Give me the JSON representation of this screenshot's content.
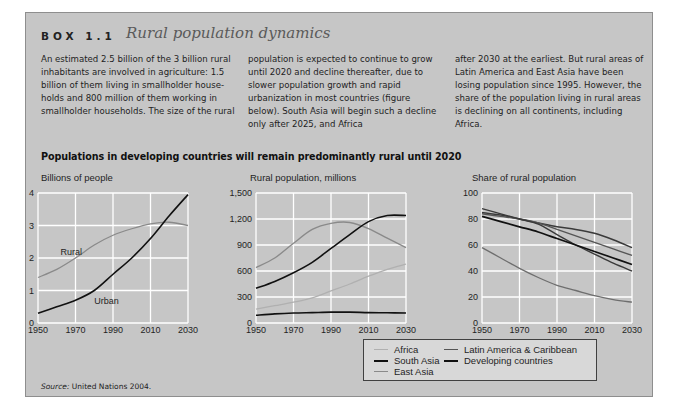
{
  "box": {
    "label": "BOX 1.1",
    "title": "Rural population dynamics",
    "paragraphs": [
      "An estimated 2.5 billion of the 3 billion rural inhabitants are involved in agriculture: 1.5 billion of them living in smallholder house-holds and 800 million of them working in smallholder households. The size of the rural",
      "population is expected to continue to grow until 2020 and decline thereafter, due to slower population growth and rapid urbanization in most countries (figure below). South Asia will begin such a decline only after 2025, and Africa",
      "after 2030 at the earliest. But rural areas of Latin America and East Asia have been losing population since 1995. However, the share of the population living in rural areas is declining on all continents, including Africa."
    ],
    "figure_title": "Populations in developing countries will remain predominantly rural until 2020",
    "source_label": "Source:",
    "source_text": " United Nations 2004."
  },
  "colors": {
    "panel_bg": "#c6c6c6",
    "grid": "#ffffff",
    "dark_line": "#111111",
    "mid_line": "#6e6e6e",
    "light_line": "#9a9a9a",
    "very_light_line": "#b4b4b4"
  },
  "legend": {
    "items": [
      {
        "label": "Africa",
        "color": "#b0b0b0"
      },
      {
        "label": "South Asia",
        "color": "#111111"
      },
      {
        "label": "East Asia",
        "color": "#8a8a8a"
      },
      {
        "label": "Latin America & Caribbean",
        "color": "#6e6e6e"
      },
      {
        "label": "Developing countries",
        "color": "#111111"
      }
    ]
  },
  "chart_data": [
    {
      "type": "line",
      "title": "Billions of people",
      "xlabel": "",
      "ylabel": "Billions of people",
      "x": [
        1950,
        1960,
        1970,
        1980,
        1990,
        2000,
        2010,
        2020,
        2030
      ],
      "xticks": [
        "1950",
        "1970",
        "1990",
        "2010",
        "2030"
      ],
      "yticks": [
        "0",
        "1",
        "2",
        "3",
        "4"
      ],
      "ylim": [
        0,
        4
      ],
      "grid": true,
      "series": [
        {
          "name": "Rural",
          "color": "#8a8a8a",
          "values": [
            1.4,
            1.65,
            2.0,
            2.4,
            2.7,
            2.9,
            3.05,
            3.1,
            3.0
          ]
        },
        {
          "name": "Urban",
          "color": "#111111",
          "values": [
            0.3,
            0.5,
            0.7,
            1.0,
            1.5,
            2.0,
            2.6,
            3.3,
            3.95
          ]
        }
      ],
      "annotations": [
        {
          "text": "Rural",
          "x": 1962,
          "y": 2.1
        },
        {
          "text": "Urban",
          "x": 1980,
          "y": 0.6
        }
      ]
    },
    {
      "type": "line",
      "title": "Rural population, millions",
      "xlabel": "",
      "ylabel": "Rural population, millions",
      "x": [
        1950,
        1960,
        1970,
        1980,
        1990,
        2000,
        2010,
        2020,
        2030
      ],
      "xticks": [
        "1950",
        "1970",
        "1990",
        "2010",
        "2030"
      ],
      "yticks": [
        "0",
        "300",
        "600",
        "900",
        "1,200",
        "1,500"
      ],
      "ylim": [
        0,
        1500
      ],
      "grid": true,
      "legend_position": "below",
      "series": [
        {
          "name": "East Asia",
          "color": "#8a8a8a",
          "values": [
            640,
            750,
            920,
            1080,
            1150,
            1160,
            1090,
            980,
            870
          ]
        },
        {
          "name": "South Asia",
          "color": "#111111",
          "values": [
            400,
            480,
            580,
            700,
            860,
            1020,
            1170,
            1240,
            1240
          ]
        },
        {
          "name": "Africa",
          "color": "#b0b0b0",
          "values": [
            160,
            200,
            240,
            290,
            370,
            450,
            540,
            620,
            680
          ]
        },
        {
          "name": "Latin America & Caribbean",
          "color": "#111111",
          "values": [
            90,
            105,
            115,
            120,
            125,
            125,
            120,
            118,
            115
          ]
        }
      ]
    },
    {
      "type": "line",
      "title": "Share of rural population",
      "xlabel": "",
      "ylabel": "Share of rural population",
      "x": [
        1950,
        1960,
        1970,
        1980,
        1990,
        2000,
        2010,
        2020,
        2030
      ],
      "xticks": [
        "1950",
        "1970",
        "1990",
        "2010",
        "2030"
      ],
      "yticks": [
        "0",
        "20",
        "40",
        "60",
        "80",
        "100"
      ],
      "ylim": [
        0,
        100
      ],
      "grid": true,
      "series": [
        {
          "name": "Africa",
          "color": "#3a3a3a",
          "values": [
            85,
            83,
            80,
            77,
            74,
            72,
            69,
            64,
            58
          ]
        },
        {
          "name": "South Asia",
          "color": "#555555",
          "values": [
            84,
            82,
            80,
            77,
            72,
            67,
            62,
            57,
            52
          ]
        },
        {
          "name": "East Asia",
          "color": "#3a3a3a",
          "values": [
            88,
            84,
            80,
            76,
            68,
            60,
            53,
            46,
            40
          ]
        },
        {
          "name": "Developing countries",
          "color": "#111111",
          "values": [
            82,
            78,
            74,
            70,
            65,
            60,
            55,
            50,
            45
          ]
        },
        {
          "name": "Latin America & Caribbean",
          "color": "#6e6e6e",
          "values": [
            58,
            50,
            42,
            35,
            29,
            25,
            21,
            18,
            16
          ]
        }
      ]
    }
  ]
}
